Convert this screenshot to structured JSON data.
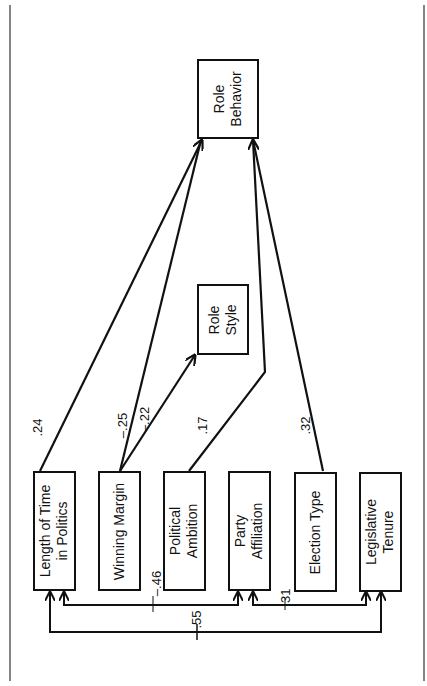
{
  "diagram": {
    "orientation": "rotated-90-ccw",
    "nodes": {
      "role_behavior": {
        "line1": "Role",
        "line2": "Behavior"
      },
      "role_style": {
        "line1": "Role",
        "line2": "Style"
      },
      "length_of_time": {
        "line1": "Length of Time",
        "line2": "in Politics"
      },
      "winning_margin": {
        "line1": "Winning Margin",
        "line2": ""
      },
      "political_ambition": {
        "line1": "Political",
        "line2": "Ambition"
      },
      "party_affiliation": {
        "line1": "Party",
        "line2": "Affiliation"
      },
      "election_type": {
        "line1": "Election Type",
        "line2": ""
      },
      "legislative_tenure": {
        "line1": "Legislative",
        "line2": "Tenure"
      }
    },
    "edges": [
      {
        "from": "Length of Time in Politics",
        "to": "Role Behavior",
        "coef": ".24"
      },
      {
        "from": "Winning Margin",
        "to": "Role Behavior",
        "coef": "–.25"
      },
      {
        "from": "Winning Margin",
        "to": "Role Style",
        "coef": "–.22"
      },
      {
        "from": "Political Ambition",
        "to": "Role Behavior",
        "coef": ".17"
      },
      {
        "from": "Election Type",
        "to": "Role Behavior",
        "coef": ".32"
      },
      {
        "from": "Length of Time in Politics",
        "to": "Party Affiliation",
        "coef": "–.46",
        "type": "correlation"
      },
      {
        "from": "Party Affiliation",
        "to": "Legislative Tenure",
        "coef": ".31",
        "type": "correlation"
      },
      {
        "from": "Length of Time in Politics",
        "to": "Legislative Tenure",
        "coef": ".55",
        "type": "correlation"
      }
    ],
    "coefficients": {
      "lt_rb": ".24",
      "wm_rb": "–.25",
      "wm_rs": "–.22",
      "pa_rb": ".17",
      "et_rb": ".32",
      "lt_party": "–.46",
      "party_lt2": ".31",
      "lt_tenure": ".55"
    }
  }
}
